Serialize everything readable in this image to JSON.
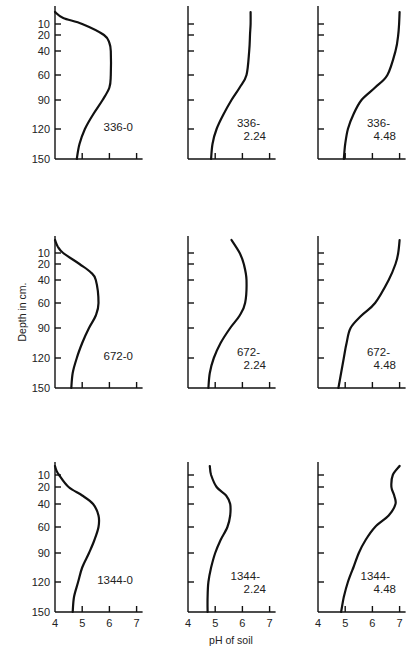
{
  "chart_data": {
    "type": "line",
    "layout": "3x3 small multiples",
    "xlabel": "pH of soil",
    "ylabel": "Depth in cm.",
    "x_ticks": [
      4,
      5,
      6,
      7
    ],
    "y_ticks": [
      10,
      20,
      40,
      60,
      90,
      120,
      150
    ],
    "xlim": [
      4,
      7
    ],
    "ylim": [
      150,
      0
    ],
    "grid": false,
    "panels": [
      {
        "label": "336-0",
        "row": 0,
        "col": 0,
        "depth": [
          0,
          5,
          10,
          20,
          30,
          40,
          60,
          75,
          90,
          105,
          120,
          135,
          150
        ],
        "ph": [
          4.0,
          4.3,
          5.0,
          5.8,
          6.0,
          6.05,
          6.05,
          6.0,
          5.75,
          5.4,
          5.1,
          4.9,
          4.8
        ]
      },
      {
        "label": "336-\n2.24",
        "row": 0,
        "col": 1,
        "depth": [
          0,
          10,
          20,
          40,
          60,
          75,
          90,
          105,
          120,
          135,
          150
        ],
        "ph": [
          6.3,
          6.3,
          6.28,
          6.25,
          6.15,
          5.9,
          5.6,
          5.3,
          5.05,
          4.9,
          4.85
        ]
      },
      {
        "label": "336-\n4.48",
        "row": 0,
        "col": 2,
        "depth": [
          0,
          10,
          20,
          40,
          60,
          75,
          90,
          105,
          120,
          135,
          150
        ],
        "ph": [
          7.0,
          6.98,
          6.95,
          6.85,
          6.55,
          6.1,
          5.6,
          5.3,
          5.1,
          5.0,
          4.95
        ]
      },
      {
        "label": "672-0",
        "row": 1,
        "col": 0,
        "depth": [
          0,
          5,
          10,
          20,
          30,
          40,
          60,
          75,
          90,
          105,
          120,
          135,
          150
        ],
        "ph": [
          4.0,
          4.1,
          4.3,
          4.9,
          5.3,
          5.5,
          5.6,
          5.5,
          5.25,
          5.0,
          4.8,
          4.65,
          4.6
        ]
      },
      {
        "label": "672-\n2.24",
        "row": 1,
        "col": 1,
        "depth": [
          0,
          10,
          20,
          40,
          60,
          75,
          90,
          105,
          120,
          135,
          150
        ],
        "ph": [
          5.6,
          5.9,
          6.05,
          6.15,
          6.1,
          5.9,
          5.55,
          5.2,
          4.95,
          4.8,
          4.75
        ]
      },
      {
        "label": "672-\n4.48",
        "row": 1,
        "col": 2,
        "depth": [
          0,
          10,
          20,
          40,
          60,
          75,
          90,
          105,
          120,
          135,
          150
        ],
        "ph": [
          7.0,
          6.95,
          6.85,
          6.6,
          6.1,
          5.6,
          5.2,
          5.05,
          4.95,
          4.85,
          4.75
        ]
      },
      {
        "label": "1344-0",
        "row": 2,
        "col": 0,
        "depth": [
          0,
          5,
          10,
          20,
          30,
          40,
          50,
          60,
          75,
          90,
          105,
          120,
          135,
          150
        ],
        "ph": [
          4.0,
          4.05,
          4.15,
          4.5,
          5.0,
          5.4,
          5.6,
          5.6,
          5.45,
          5.25,
          5.0,
          4.85,
          4.7,
          4.65
        ]
      },
      {
        "label": "1344-\n2.24",
        "row": 2,
        "col": 1,
        "depth": [
          0,
          10,
          20,
          30,
          40,
          50,
          60,
          75,
          90,
          105,
          120,
          135,
          150
        ],
        "ph": [
          4.8,
          4.85,
          5.05,
          5.4,
          5.55,
          5.55,
          5.45,
          5.2,
          5.0,
          4.85,
          4.75,
          4.72,
          4.72
        ]
      },
      {
        "label": "1344-\n4.48",
        "row": 2,
        "col": 2,
        "depth": [
          0,
          10,
          20,
          30,
          40,
          50,
          60,
          75,
          90,
          105,
          120,
          135,
          150
        ],
        "ph": [
          7.0,
          6.75,
          6.7,
          6.8,
          6.85,
          6.6,
          6.1,
          5.75,
          5.5,
          5.3,
          5.1,
          4.95,
          4.85
        ]
      }
    ]
  },
  "labels": {
    "y_axis_title": "Depth in cm.",
    "x_axis_title": "pH of soil"
  }
}
